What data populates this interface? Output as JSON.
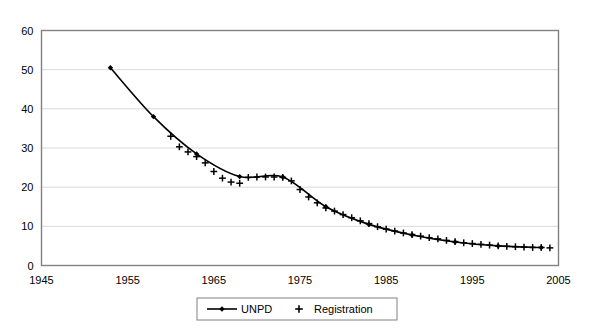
{
  "chart_data": {
    "type": "line",
    "title": "",
    "subtitle": "",
    "xlabel": "",
    "ylabel": "",
    "xlim": [
      1945,
      2005
    ],
    "ylim": [
      0,
      60
    ],
    "xticks": [
      1945,
      1955,
      1965,
      1975,
      1985,
      1995,
      2005
    ],
    "yticks": [
      0,
      10,
      20,
      30,
      40,
      50,
      60
    ],
    "xtick_labels": [
      "1945",
      "1955",
      "1965",
      "1975",
      "1985",
      "1995",
      "2005"
    ],
    "ytick_labels": [
      "0",
      "10",
      "20",
      "30",
      "40",
      "50",
      "60"
    ],
    "grid": "horizontal",
    "legend_position": "bottom-center",
    "series": [
      {
        "name": "UNPD",
        "marker": "diamond",
        "line": "solid",
        "color": "#000000",
        "x": [
          1953,
          1958,
          1963,
          1968,
          1973,
          1978,
          1983,
          1988,
          1993,
          1998,
          2003
        ],
        "values": [
          50.5,
          38.0,
          28.5,
          22.7,
          22.6,
          15.0,
          10.5,
          7.8,
          6.0,
          5.0,
          4.6
        ]
      },
      {
        "name": "Registration",
        "marker": "plus",
        "line": "none",
        "color": "#000000",
        "x": [
          1960,
          1961,
          1962,
          1963,
          1964,
          1965,
          1966,
          1967,
          1968,
          1969,
          1970,
          1971,
          1972,
          1973,
          1974,
          1975,
          1976,
          1977,
          1978,
          1979,
          1980,
          1981,
          1982,
          1983,
          1984,
          1985,
          1986,
          1987,
          1988,
          1989,
          1990,
          1991,
          1992,
          1993,
          1994,
          1995,
          1996,
          1997,
          1998,
          1999,
          2000,
          2001,
          2002,
          2003,
          2004
        ],
        "values": [
          33.0,
          30.3,
          29.0,
          27.8,
          26.2,
          24.0,
          22.3,
          21.3,
          21.0,
          22.5,
          22.6,
          22.6,
          22.6,
          22.5,
          21.6,
          19.4,
          17.5,
          16.0,
          14.7,
          13.9,
          13.0,
          12.2,
          11.4,
          10.7,
          9.9,
          9.3,
          8.8,
          8.3,
          7.9,
          7.5,
          7.1,
          6.8,
          6.4,
          6.1,
          5.8,
          5.6,
          5.4,
          5.2,
          5.0,
          4.9,
          4.8,
          4.7,
          4.6,
          4.6,
          4.5
        ]
      }
    ]
  },
  "legend": {
    "items": [
      {
        "label": "UNPD",
        "marker": "diamond-line"
      },
      {
        "label": "Registration",
        "marker": "plus"
      }
    ]
  },
  "axes": {
    "y_label_values": [
      "60",
      "50",
      "40",
      "30",
      "20",
      "10",
      "0"
    ],
    "x_label_values": [
      "1945",
      "1955",
      "1965",
      "1975",
      "1985",
      "1995",
      "2005"
    ]
  },
  "colors": {
    "background": "#ffffff",
    "axis": "#808080",
    "grid": "#d9d9d9",
    "series": "#000000",
    "text": "#000000"
  }
}
